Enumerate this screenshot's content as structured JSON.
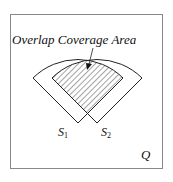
{
  "diagram": {
    "title": "Overlap Coverage Area",
    "region_label": "Q",
    "sensors": [
      {
        "symbol": "S",
        "subscript": "1"
      },
      {
        "symbol": "S",
        "subscript": "2"
      }
    ],
    "colors": {
      "stroke": "#222222",
      "frame": "#888888",
      "hatch": "#333333",
      "background": "#ffffff"
    }
  }
}
